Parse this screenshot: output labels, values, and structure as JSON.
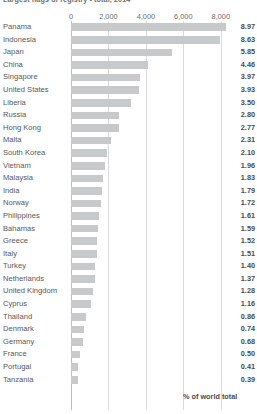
{
  "chart_data": {
    "type": "bar",
    "orientation": "horizontal",
    "title": "Largest flags of registry - total, 2014",
    "xlabel": "",
    "ylabel": "",
    "xlim": [
      0,
      8600
    ],
    "xticks": [
      0,
      2000,
      4000,
      6000,
      8000
    ],
    "xtick_labels": [
      "0",
      "2,000",
      "4,000",
      "6,000",
      "8,000"
    ],
    "grid": true,
    "legend_label": "% of world total",
    "legend_position": "bottom-right",
    "value_label_series": "% of world total",
    "categories": [
      "Panama",
      "Indonesia",
      "Japan",
      "China",
      "Singapore",
      "United States",
      "Liberia",
      "Russia",
      "Hong Kong",
      "Malta",
      "South Korea",
      "Vietnam",
      "Malaysia",
      "India",
      "Norway",
      "Philippines",
      "Bahamas",
      "Greece",
      "Italy",
      "Turkey",
      "Netherlands",
      "United Kingdom",
      "Cyprus",
      "Thailand",
      "Denmark",
      "Germany",
      "France",
      "Portugal",
      "Tanzania"
    ],
    "values": [
      8.97,
      8.63,
      5.85,
      4.46,
      3.97,
      3.93,
      3.5,
      2.8,
      2.77,
      2.31,
      2.1,
      1.96,
      1.83,
      1.79,
      1.72,
      1.61,
      1.59,
      1.52,
      1.51,
      1.4,
      1.37,
      1.28,
      1.16,
      0.86,
      0.74,
      0.68,
      0.5,
      0.41,
      0.39
    ],
    "bar_lengths": [
      8260,
      7950,
      5390,
      4110,
      3660,
      3620,
      3225,
      2580,
      2550,
      2130,
      1935,
      1805,
      1685,
      1650,
      1585,
      1485,
      1465,
      1400,
      1390,
      1290,
      1262,
      1180,
      1068,
      792,
      682,
      626,
      460,
      378,
      360
    ],
    "value_suffix": ""
  },
  "colors": {
    "bar": "#c8c9ca",
    "grid": "#d9dadb",
    "axis": "#bcbec0",
    "text": "#58585a",
    "value_text": "#4a4a4c"
  }
}
